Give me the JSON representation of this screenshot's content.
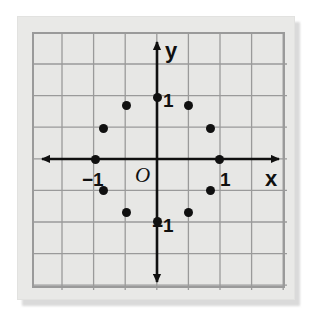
{
  "figure": {
    "title": "",
    "origin_label": "O",
    "x_axis_name": "x",
    "y_axis_name": "y",
    "tick_labels": [
      {
        "text": "1",
        "axis": "y",
        "value": 1,
        "left_px": 129,
        "top_px": 57
      },
      {
        "text": "−1",
        "axis": "y",
        "value": -1,
        "left_px": 118,
        "top_px": 182
      },
      {
        "text": "−1",
        "axis": "x",
        "value": -1,
        "left_px": 48,
        "top_px": 136
      },
      {
        "text": "1",
        "axis": "x",
        "value": 1,
        "left_px": 186,
        "top_px": 136
      }
    ],
    "colors": {
      "paper": "#e9e9e7",
      "plot_background": "#e7e7e5",
      "grid_line": "#9a9a9a",
      "plot_border": "#9a9a9a",
      "axis": "#101010",
      "point": "#101010",
      "shadow": "#bdbdbd"
    }
  },
  "chart_data": {
    "type": "scatter",
    "title": "",
    "xlabel": "x",
    "ylabel": "y",
    "xlim": [
      -2,
      2
    ],
    "ylim": [
      -2,
      2
    ],
    "grid": true,
    "grid_step": 0.5,
    "legend": "none",
    "origin_label": "O",
    "xticks": [
      -1,
      1
    ],
    "xticklabels": [
      "−1",
      "1"
    ],
    "yticks": [
      -1,
      1
    ],
    "yticklabels": [
      "−1",
      "1"
    ],
    "series": [
      {
        "name": "unit circle points",
        "marker": "filled-circle",
        "color": "#101010",
        "points": [
          {
            "x": 1.0,
            "y": 0.0,
            "angle_deg": 0
          },
          {
            "x": 0.87,
            "y": 0.5,
            "angle_deg": 30
          },
          {
            "x": 0.5,
            "y": 0.87,
            "angle_deg": 60
          },
          {
            "x": 0.0,
            "y": 1.0,
            "angle_deg": 90
          },
          {
            "x": -0.5,
            "y": 0.87,
            "angle_deg": 120
          },
          {
            "x": -0.87,
            "y": 0.5,
            "angle_deg": 150
          },
          {
            "x": -1.0,
            "y": 0.0,
            "angle_deg": 180
          },
          {
            "x": -0.87,
            "y": -0.5,
            "angle_deg": 210
          },
          {
            "x": -0.5,
            "y": -0.87,
            "angle_deg": 240
          },
          {
            "x": 0.0,
            "y": -1.0,
            "angle_deg": 270
          },
          {
            "x": 0.5,
            "y": -0.87,
            "angle_deg": 300
          },
          {
            "x": 0.87,
            "y": -0.5,
            "angle_deg": 330
          }
        ]
      }
    ]
  },
  "geometry": {
    "plot_width": 253,
    "plot_height": 256,
    "origin_x_px": 123,
    "origin_y_px": 125,
    "unit_px": 62,
    "grid_step_px": 31.6,
    "grid_first_x_px": 28,
    "grid_first_y_px": 30
  }
}
